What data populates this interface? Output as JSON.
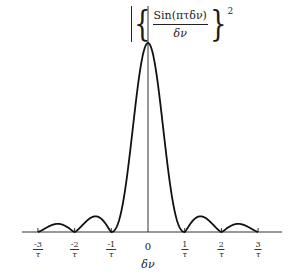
{
  "chart_data": {
    "type": "line",
    "title": "",
    "function_label": {
      "numerator": "Sin(πτδν)",
      "denominator": "δν",
      "exponent": "2"
    },
    "xlabel": "δν",
    "ylabel": "",
    "x_ticks": [
      {
        "value": -3,
        "numerator": "-3",
        "denominator": "τ"
      },
      {
        "value": -2,
        "numerator": "-2",
        "denominator": "τ"
      },
      {
        "value": -1,
        "numerator": "-1",
        "denominator": "τ"
      },
      {
        "value": 0,
        "label": "0"
      },
      {
        "value": 1,
        "numerator": "1",
        "denominator": "τ"
      },
      {
        "value": 2,
        "numerator": "2",
        "denominator": "τ"
      },
      {
        "value": 3,
        "numerator": "3",
        "denominator": "τ"
      }
    ],
    "x_units": "1/τ",
    "xlim": [
      -3.6,
      3.6
    ],
    "ylim": [
      0,
      1
    ],
    "grid": false,
    "legend": null,
    "series": [
      {
        "name": "|sin(πτδν)/δν|²",
        "description": "sinc-squared main lobe at 0, zeros at integer multiples of 1/τ, decaying side lobes",
        "x": [
          -3,
          -2.5,
          -2,
          -1.5,
          -1,
          -0.5,
          0,
          0.5,
          1,
          1.5,
          2,
          2.5,
          3
        ],
        "y": [
          0,
          0.016,
          0,
          0.045,
          0,
          0.405,
          1.0,
          0.405,
          0,
          0.045,
          0,
          0.016,
          0
        ]
      }
    ]
  },
  "labels": {
    "zero": "0",
    "xlabel": "δν"
  }
}
